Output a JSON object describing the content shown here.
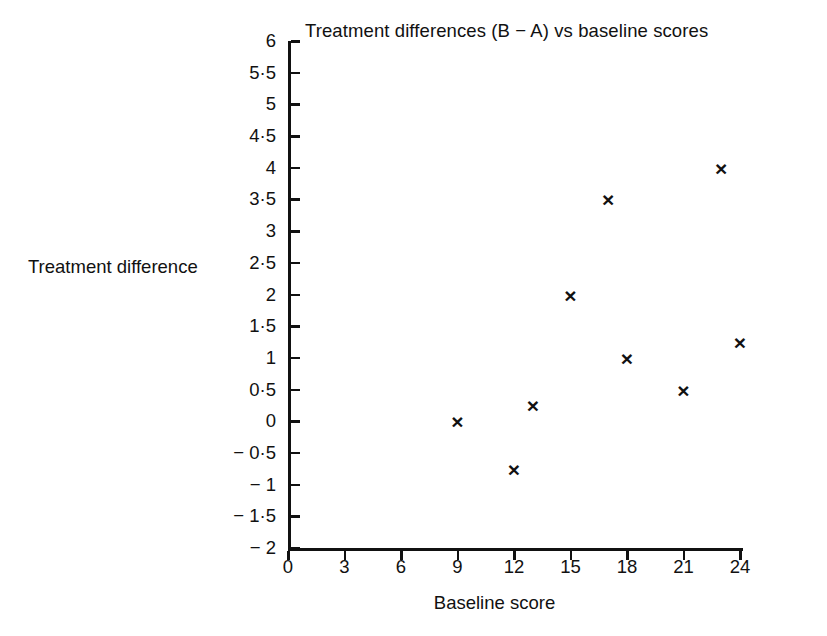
{
  "chart_data": {
    "type": "scatter",
    "title": "Treatment differences (B − A) vs baseline scores",
    "xlabel": "Baseline score",
    "ylabel": "Treatment difference",
    "xlim": [
      0,
      24
    ],
    "ylim": [
      -2,
      6
    ],
    "grid": false,
    "legend": null,
    "marker": "×",
    "marker_color": "#111111",
    "x": [
      9,
      12,
      13,
      15,
      17,
      18,
      21,
      23,
      24
    ],
    "y": [
      0,
      -0.75,
      0.25,
      2,
      3.5,
      1,
      0.5,
      4,
      1.25
    ],
    "points": [
      {
        "x": 9,
        "y": 0
      },
      {
        "x": 12,
        "y": -0.75
      },
      {
        "x": 13,
        "y": 0.25
      },
      {
        "x": 15,
        "y": 2
      },
      {
        "x": 17,
        "y": 3.5
      },
      {
        "x": 18,
        "y": 1
      },
      {
        "x": 21,
        "y": 0.5
      },
      {
        "x": 23,
        "y": 4
      },
      {
        "x": 24,
        "y": 1.25
      }
    ],
    "xticks": [
      0,
      3,
      6,
      9,
      12,
      15,
      18,
      21,
      24
    ],
    "xticklabels": [
      "0",
      "3",
      "6",
      "9",
      "12",
      "15",
      "18",
      "21",
      "24"
    ],
    "yticks": [
      6,
      5.5,
      5,
      4.5,
      4,
      3.5,
      3,
      2.5,
      2,
      1.5,
      1,
      0.5,
      0,
      -0.5,
      -1,
      -1.5,
      -2
    ],
    "yticklabels": [
      "6",
      "5·5",
      "5",
      "4·5",
      "4",
      "3·5",
      "3",
      "2·5",
      "2",
      "1·5",
      "1",
      "0·5",
      "0",
      "− 0·5",
      "− 1",
      "− 1·5",
      "− 2"
    ]
  }
}
